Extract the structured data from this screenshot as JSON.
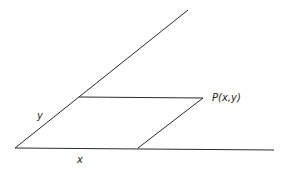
{
  "diagram": {
    "labels": {
      "x_axis": "x",
      "y_axis": "y",
      "point": "P(x,y)"
    },
    "elements": [
      {
        "name": "x-axis",
        "kind": "line"
      },
      {
        "name": "oblique-y-axis",
        "kind": "line"
      },
      {
        "name": "parallel-to-x",
        "kind": "line"
      },
      {
        "name": "parallel-to-y",
        "kind": "line"
      }
    ]
  }
}
